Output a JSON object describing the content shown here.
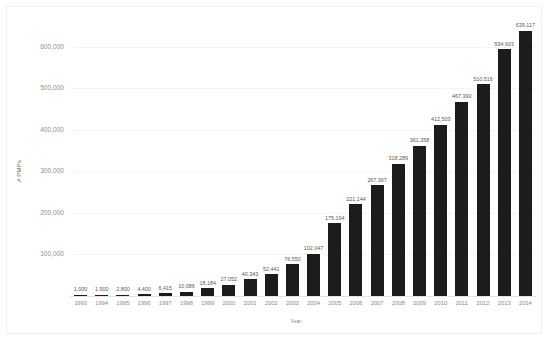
{
  "chart_data": {
    "type": "bar",
    "title": "",
    "xlabel": "Year",
    "ylabel": "# PMPs",
    "categories": [
      "1993",
      "1994",
      "1995",
      "1996",
      "1997",
      "1998",
      "1999",
      "2000",
      "2001",
      "2002",
      "2003",
      "2004",
      "2005",
      "2006",
      "2007",
      "2008",
      "2009",
      "2010",
      "2011",
      "2012",
      "2013",
      "2014"
    ],
    "values": [
      1000,
      1900,
      2800,
      4400,
      6415,
      10086,
      18184,
      27052,
      40343,
      52441,
      76550,
      102047,
      175194,
      221144,
      267367,
      318289,
      361358,
      412503,
      467390,
      510516,
      594603,
      639117
    ],
    "value_labels": [
      "1,000",
      "1,900",
      "2,800",
      "4,400",
      "6,415",
      "10,086",
      "18,184",
      "27,052",
      "40,343",
      "52,441",
      "76,550",
      "102,047",
      "175,194",
      "221,144",
      "267,367",
      "318,289",
      "361,358",
      "412,503",
      "467,390",
      "510,516",
      "594,603",
      "639,117"
    ],
    "ytick_labels": [
      "100,000",
      "200,000",
      "300,000",
      "400,000",
      "500,000",
      "600,000"
    ],
    "ytick_values": [
      100000,
      200000,
      300000,
      400000,
      500000,
      600000
    ],
    "ylim": [
      0,
      660000
    ],
    "grid": true,
    "legend": "none",
    "bar_color": "#1c1c1c",
    "gridline_color": "#f4f4f4",
    "axis_text_color": "#8a8a8a"
  }
}
